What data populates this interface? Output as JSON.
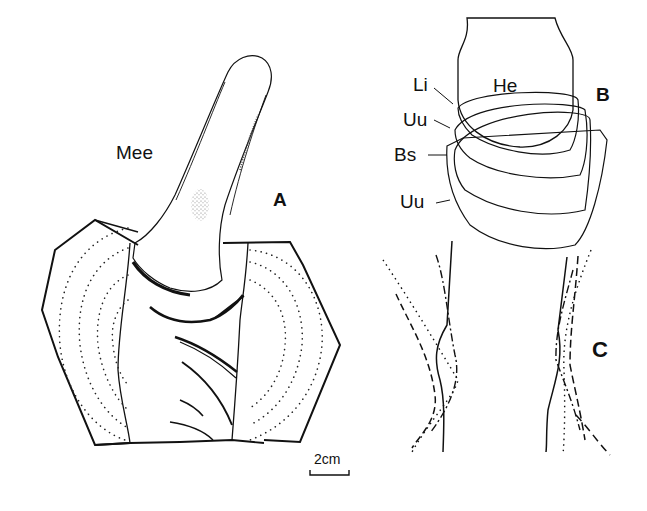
{
  "figure": {
    "panels": [
      {
        "id": "A",
        "label": "A",
        "description": "Tubular stem structure emerging from banded segment"
      },
      {
        "id": "B",
        "label": "B",
        "description": "Head with layered bands"
      },
      {
        "id": "C",
        "label": "C",
        "description": "Interwoven line traces"
      }
    ],
    "panel_a": {
      "panel_label": "A",
      "structure_label": "Mee"
    },
    "panel_b": {
      "panel_label": "B",
      "labels": {
        "he": "He",
        "li": "Li",
        "uu_upper": "Uu",
        "bs": "Bs",
        "uu_lower": "Uu"
      }
    },
    "panel_c": {
      "panel_label": "C"
    },
    "scale_bar": {
      "label": "2cm"
    },
    "colors": {
      "ink": "#111111",
      "background": "#ffffff"
    }
  }
}
